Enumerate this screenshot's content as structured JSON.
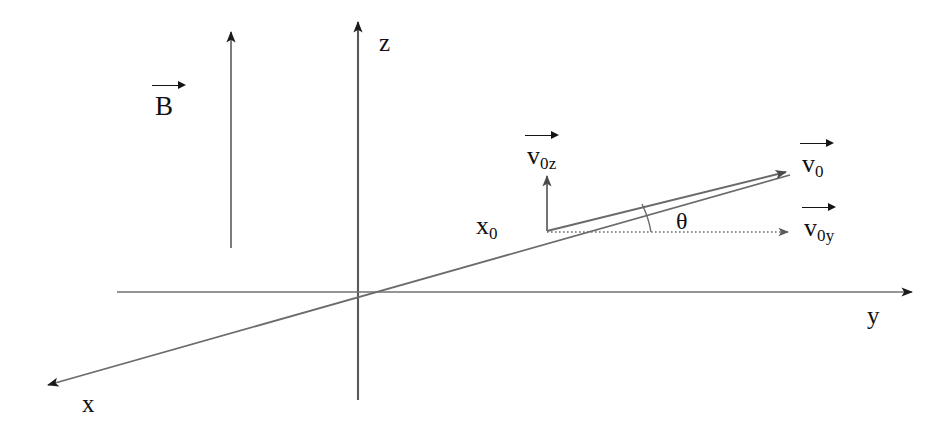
{
  "figure": {
    "title": "",
    "type": "physics-vector-diagram",
    "background_color": "#ffffff",
    "line_color": "#555555",
    "text_color": "#101010",
    "width": 951,
    "height": 435
  },
  "axes": [
    {
      "name": "z-axis",
      "label": "z",
      "direction": "up"
    },
    {
      "name": "y-axis",
      "label": "y",
      "direction": "right"
    },
    {
      "name": "x-axis",
      "label": "x",
      "direction": "down-left"
    }
  ],
  "labels": {
    "z_axis": "z",
    "y_axis": "y",
    "x_axis": "x",
    "magnetic_field": "B",
    "initial_position": {
      "base": "x",
      "sub": "0"
    },
    "velocity_total": {
      "base": "v",
      "sub": "0"
    },
    "velocity_z": {
      "base": "v",
      "sub": "0z"
    },
    "velocity_y": {
      "base": "v",
      "sub": "0y"
    },
    "angle": "θ"
  },
  "vectors": [
    {
      "name": "magnetic-field-vector",
      "label": "B",
      "style": "solid",
      "direction": "up",
      "description": "uniform magnetic field pointing along +z"
    },
    {
      "name": "initial-velocity-vector",
      "label": "v0",
      "style": "solid",
      "direction": "up-right",
      "description": "initial velocity at angle theta above the y axis"
    },
    {
      "name": "velocity-z-component-vector",
      "label": "v0z",
      "style": "solid",
      "direction": "up",
      "description": "z component of initial velocity"
    },
    {
      "name": "velocity-y-component-vector",
      "label": "v0y",
      "style": "dotted",
      "direction": "right",
      "description": "y component of initial velocity"
    }
  ],
  "annotations": {
    "angle_between": "theta between v0 and v0y",
    "start_point": "x0"
  }
}
